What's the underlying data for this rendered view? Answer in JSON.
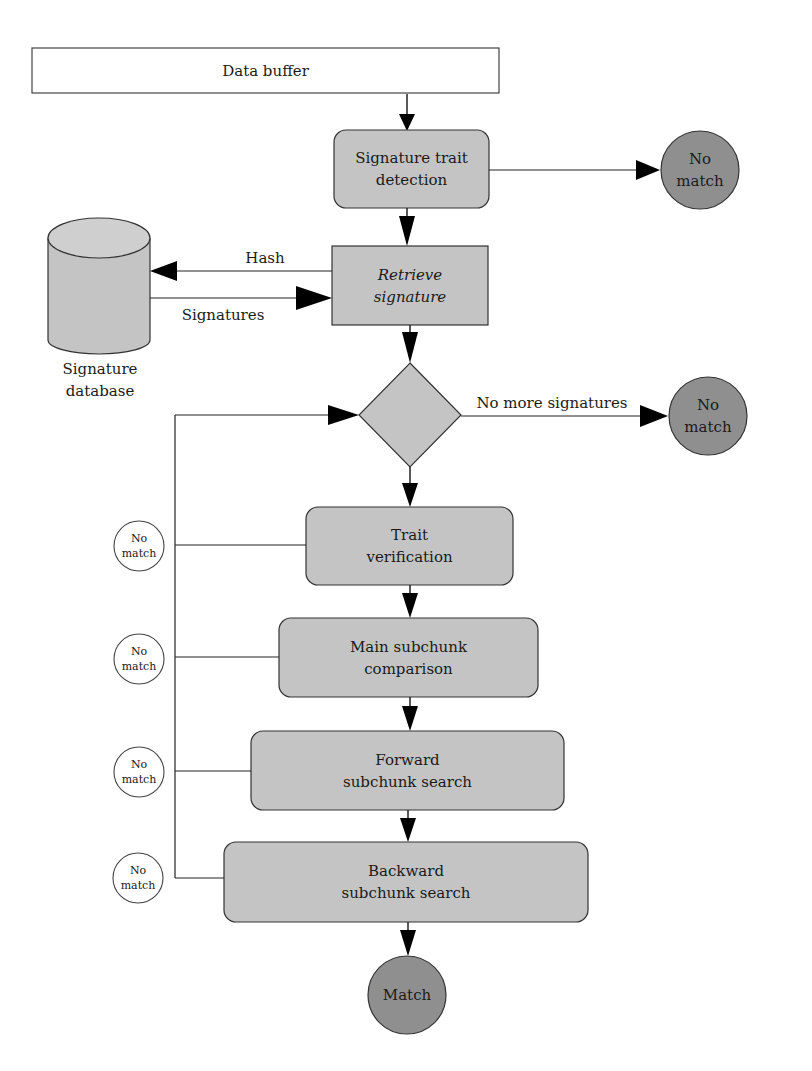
{
  "diagram": {
    "data_buffer": "Data buffer",
    "signature_trait_detection": [
      "Signature trait",
      "detection"
    ],
    "retrieve_signature": [
      "Retrieve",
      "signature"
    ],
    "signature_database": [
      "Signature",
      "database"
    ],
    "hash_label": "Hash",
    "signatures_label": "Signatures",
    "no_more_signatures_label": "No more signatures",
    "trait_verification": [
      "Trait",
      "verification"
    ],
    "main_subchunk_comparison": [
      "Main subchunk",
      "comparison"
    ],
    "forward_subchunk_search": [
      "Forward",
      "subchunk search"
    ],
    "backward_subchunk_search": [
      "Backward",
      "subchunk search"
    ],
    "no_match": [
      "No",
      "match"
    ],
    "match": "Match"
  },
  "colors": {
    "box_fill": "#c4c4c4",
    "terminal_fill": "#8f8f8f",
    "stroke": "#333333",
    "white_node": "#ffffff"
  }
}
